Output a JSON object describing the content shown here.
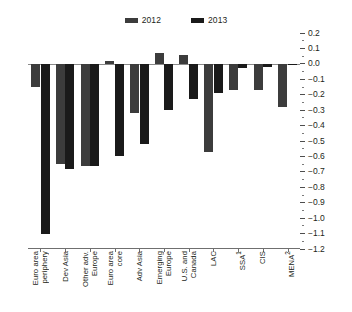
{
  "legend": {
    "entries": [
      {
        "label": "2012",
        "color": "#3c3c3c"
      },
      {
        "label": "2013",
        "color": "#1a1a1a"
      }
    ]
  },
  "axis": {
    "labels": [
      "0.2",
      "0.1",
      "0.0",
      "-0.1",
      "-0.2",
      "-0.3",
      "-0.4",
      "-0.5",
      "-0.6",
      "-0.7",
      "-0.8",
      "-0.9",
      "-1.0",
      "-1.1",
      "-1.2"
    ]
  },
  "categories": [
    {
      "line1": "Euro area",
      "line2": "periphery",
      "sup": ""
    },
    {
      "line1": "Dev Asia",
      "line2": "",
      "sup": ""
    },
    {
      "line1": "Other adv.",
      "line2": "Europe",
      "sup": ""
    },
    {
      "line1": "Euro area",
      "line2": "core",
      "sup": ""
    },
    {
      "line1": "Adv Asia",
      "line2": "",
      "sup": ""
    },
    {
      "line1": "Emerging",
      "line2": "Europe",
      "sup": ""
    },
    {
      "line1": "U.S. and",
      "line2": "Canada",
      "sup": ""
    },
    {
      "line1": "LAC",
      "line2": "",
      "sup": ""
    },
    {
      "line1": "SSA",
      "line2": "",
      "sup": "1"
    },
    {
      "line1": "CIS",
      "line2": "",
      "sup": ""
    },
    {
      "line1": "MENA",
      "line2": "",
      "sup": "2"
    }
  ],
  "chart_data": {
    "type": "bar",
    "title": "",
    "subtitle": "",
    "xlabel": "",
    "ylabel": "",
    "ylim": [
      -1.2,
      0.2
    ],
    "ytick_step": 0.1,
    "grid": false,
    "legend_position": "top-center",
    "axis_position": "right",
    "orientation": "vertical",
    "grouping": "grouped",
    "categories": [
      "Euro area periphery",
      "Dev Asia",
      "Other adv. Europe",
      "Euro area core",
      "Adv Asia",
      "Emerging Europe",
      "U.S. and Canada",
      "LAC",
      "SSA",
      "CIS",
      "MENA"
    ],
    "series": [
      {
        "name": "2012",
        "color": "#3c3c3c",
        "values": [
          -0.15,
          -0.65,
          -0.66,
          0.02,
          -0.32,
          0.07,
          0.06,
          -0.57,
          -0.17,
          -0.17,
          -0.28
        ]
      },
      {
        "name": "2013",
        "color": "#1a1a1a",
        "values": [
          -1.1,
          -0.68,
          -0.66,
          -0.6,
          -0.52,
          -0.3,
          -0.23,
          -0.19,
          -0.03,
          -0.02,
          -0.01
        ]
      }
    ],
    "footnotes": [
      "1",
      "2"
    ]
  }
}
